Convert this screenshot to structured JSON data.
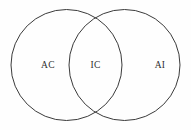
{
  "figure": {
    "type": "venn-diagram",
    "width": 191,
    "height": 130,
    "background_color": "#fefefe",
    "stroke_color": "#3b3b3b",
    "label_color": "#2e2e2e"
  },
  "circles": [
    {
      "id": "left-circle",
      "name": "left-set-circle",
      "cx": 66.5,
      "cy": 65,
      "r": 55.5
    },
    {
      "id": "right-circle",
      "name": "right-set-circle",
      "cx": 124.5,
      "cy": 65,
      "r": 55.5
    }
  ],
  "labels": [
    {
      "id": "left-only",
      "text": "AC",
      "x": 48,
      "y": 65.5
    },
    {
      "id": "intersection",
      "text": "IC",
      "x": 95.5,
      "y": 65.5
    },
    {
      "id": "right-only",
      "text": "AI",
      "x": 160,
      "y": 65.5
    }
  ]
}
